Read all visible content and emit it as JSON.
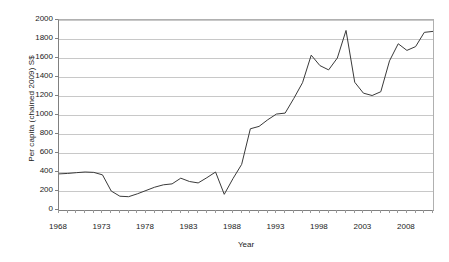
{
  "chart_data": {
    "type": "line",
    "title": "",
    "xlabel": "Year",
    "ylabel": "Per capita (chained 2009) S$",
    "xlim": [
      1968,
      2011
    ],
    "ylim": [
      0,
      2000
    ],
    "grid": true,
    "legend": "none",
    "y_ticks": [
      0,
      200,
      400,
      600,
      800,
      1000,
      1200,
      1400,
      1600,
      1800,
      2000
    ],
    "y_tick_labels": [
      "0",
      "200",
      "400",
      "600",
      "800",
      "1000",
      "1200",
      "1400",
      "1600",
      "1800",
      "2000"
    ],
    "x_tick_labels": [
      "1968",
      "1973",
      "1978",
      "1983",
      "1988",
      "1993",
      "1998",
      "2003",
      "2008"
    ],
    "x_tick_label_values": [
      1968,
      1973,
      1978,
      1983,
      1988,
      1993,
      1998,
      2003,
      2008
    ],
    "x_minor_tick_step": 1,
    "line_color": "#3a3a3a",
    "gridline_color": "#c8c8c8",
    "axis_color": "#808080",
    "x": [
      1968,
      1969,
      1970,
      1971,
      1972,
      1973,
      1974,
      1975,
      1976,
      1977,
      1978,
      1979,
      1980,
      1981,
      1982,
      1983,
      1984,
      1985,
      1986,
      1987,
      1988,
      1989,
      1990,
      1991,
      1992,
      1993,
      1994,
      1995,
      1996,
      1997,
      1998,
      1999,
      2000,
      2001,
      2002,
      2003,
      2004,
      2005,
      2006,
      2007,
      2008,
      2009,
      2010,
      2011
    ],
    "values": [
      380,
      385,
      393,
      400,
      396,
      370,
      200,
      145,
      140,
      170,
      205,
      240,
      265,
      275,
      335,
      300,
      285,
      340,
      400,
      165,
      330,
      480,
      855,
      880,
      950,
      1010,
      1020,
      1175,
      1340,
      1630,
      1520,
      1475,
      1600,
      1890,
      1345,
      1230,
      1205,
      1245,
      1570,
      1750,
      1680,
      1720,
      1870,
      1880
    ]
  }
}
